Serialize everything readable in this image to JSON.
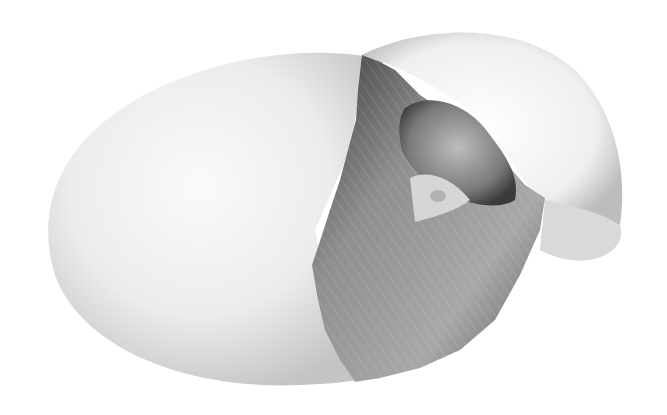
{
  "image": {
    "subject": "hatching-egg-illustration",
    "style": "graphite pencil drawing",
    "colors": {
      "background": "#ffffff",
      "shell_light": "#f4f4f4",
      "shell_shadow": "#c8c8c8",
      "chick_mid": "#8a8a8a",
      "chick_dark": "#2e2e2e",
      "beak": "#d8d8d8"
    }
  }
}
